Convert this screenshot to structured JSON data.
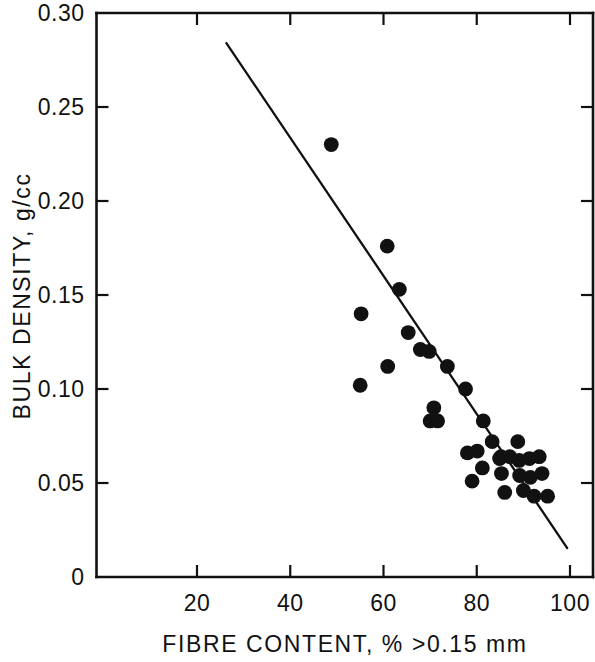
{
  "chart_data": {
    "type": "scatter",
    "title": "",
    "xlabel": "FIBRE CONTENT, % >0.15 mm",
    "ylabel": "BULK DENSITY, g/cc",
    "xlim": [
      0,
      104
    ],
    "ylim": [
      0,
      0.3
    ],
    "grid": false,
    "legend": null,
    "x_ticklabels": [
      "20",
      "40",
      "60",
      "80",
      "100"
    ],
    "x_tickvalues": [
      20,
      40,
      60,
      80,
      100
    ],
    "y_ticklabels": [
      "0",
      "0.05",
      "0.10",
      "0.15",
      "0.20",
      "0.25",
      "0.30"
    ],
    "y_tickvalues": [
      0,
      0.05,
      0.1,
      0.15,
      0.2,
      0.25,
      0.3
    ],
    "y_origin_label": "0",
    "points": [
      {
        "x": 48.8,
        "y": 0.23
      },
      {
        "x": 55.2,
        "y": 0.14
      },
      {
        "x": 55.0,
        "y": 0.102
      },
      {
        "x": 60.8,
        "y": 0.176
      },
      {
        "x": 60.9,
        "y": 0.112
      },
      {
        "x": 63.4,
        "y": 0.153
      },
      {
        "x": 65.3,
        "y": 0.13
      },
      {
        "x": 67.9,
        "y": 0.121
      },
      {
        "x": 69.8,
        "y": 0.12
      },
      {
        "x": 70.8,
        "y": 0.09
      },
      {
        "x": 70.0,
        "y": 0.083
      },
      {
        "x": 71.6,
        "y": 0.083
      },
      {
        "x": 73.7,
        "y": 0.112
      },
      {
        "x": 77.6,
        "y": 0.1
      },
      {
        "x": 78.0,
        "y": 0.066
      },
      {
        "x": 79.0,
        "y": 0.051
      },
      {
        "x": 81.4,
        "y": 0.083
      },
      {
        "x": 83.3,
        "y": 0.072
      },
      {
        "x": 84.9,
        "y": 0.063
      },
      {
        "x": 85.2,
        "y": 0.064
      },
      {
        "x": 85.3,
        "y": 0.055
      },
      {
        "x": 86.0,
        "y": 0.045
      },
      {
        "x": 87.1,
        "y": 0.064
      },
      {
        "x": 88.8,
        "y": 0.072
      },
      {
        "x": 89.1,
        "y": 0.062
      },
      {
        "x": 89.2,
        "y": 0.054
      },
      {
        "x": 90.0,
        "y": 0.046
      },
      {
        "x": 91.3,
        "y": 0.063
      },
      {
        "x": 91.5,
        "y": 0.053
      },
      {
        "x": 92.3,
        "y": 0.043
      },
      {
        "x": 93.4,
        "y": 0.064
      },
      {
        "x": 94.0,
        "y": 0.055
      },
      {
        "x": 95.2,
        "y": 0.043
      },
      {
        "x": 81.2,
        "y": 0.058
      },
      {
        "x": 80.1,
        "y": 0.067
      }
    ],
    "fit_line": {
      "x1": 26.3,
      "y1": 0.284,
      "x2": 99.4,
      "y2": 0.0154
    },
    "marker_color": "#111111",
    "line_color": "#111111",
    "axis_color": "#111111"
  }
}
